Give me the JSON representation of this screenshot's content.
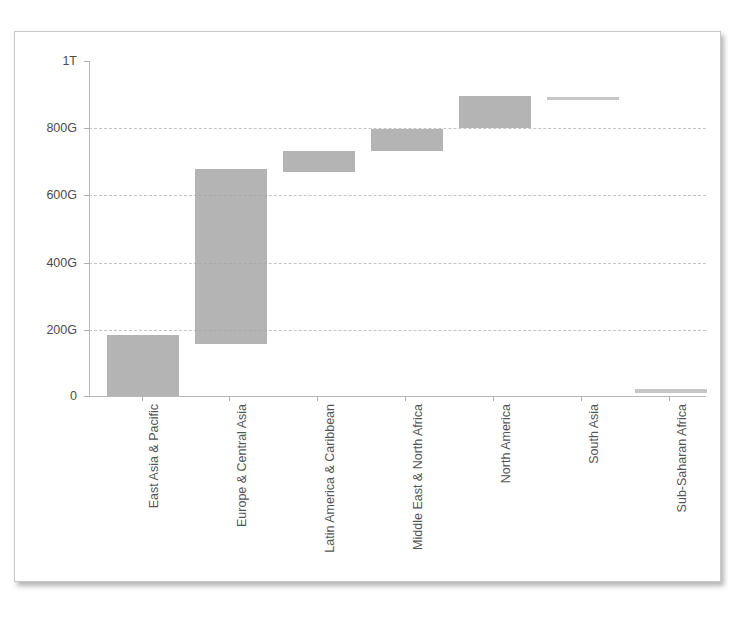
{
  "chart_data": {
    "type": "bar",
    "subtype": "waterfall-floating-bar",
    "title": "",
    "subtitle": "",
    "xlabel": "",
    "ylabel": "",
    "categories": [
      "East Asia & Pacific",
      "Europe & Central Asia",
      "Latin America & Caribbean",
      "Middle East & North Africa",
      "North America",
      "South Asia",
      "Sub-Saharan Africa"
    ],
    "bars": [
      {
        "category": "East Asia & Pacific",
        "base": 0,
        "top": 182,
        "value": 182
      },
      {
        "category": "Europe & Central Asia",
        "base": 155,
        "top": 677,
        "value": 522
      },
      {
        "category": "Latin America & Caribbean",
        "base": 668,
        "top": 731,
        "value": 63
      },
      {
        "category": "Middle East & North Africa",
        "base": 731,
        "top": 797,
        "value": 66
      },
      {
        "category": "North America",
        "base": 800,
        "top": 895,
        "value": 95
      },
      {
        "category": "South Asia",
        "base": 884,
        "top": 893,
        "value": 9
      },
      {
        "category": "Sub-Saharan Africa",
        "base": 9,
        "top": 21,
        "value": 12
      }
    ],
    "values": [
      182,
      522,
      63,
      66,
      95,
      9,
      12
    ],
    "ylim": [
      0,
      1000
    ],
    "yticks": [
      0,
      200,
      400,
      600,
      800,
      1000
    ],
    "ytick_labels": [
      "0",
      "200G",
      "400G",
      "600G",
      "800G",
      "1T"
    ],
    "units": "G = billions, T = trillions",
    "grid": true,
    "legend": false,
    "legend_position": "none",
    "bar_color": "#a3a3a3"
  },
  "axis": {
    "y_labels": [
      "1T",
      "800G",
      "600G",
      "400G",
      "200G",
      "0"
    ],
    "x_labels": [
      "East Asia & Pacific",
      "Europe & Central Asia",
      "Latin America & Caribbean",
      "Middle East & North Africa",
      "North America",
      "South Asia",
      "Sub-Saharan Africa"
    ]
  }
}
